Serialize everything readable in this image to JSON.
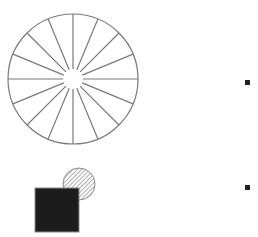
{
  "diagram": {
    "wheel": {
      "name": "spoked-wheel",
      "spoke_count": 16,
      "stroke_color": "#7a7a7a"
    },
    "composite": {
      "square": {
        "fill_color": "#1c1c1c",
        "stroke_color": "#8a8a8a"
      },
      "circle": {
        "pattern": "diagonal-hatch",
        "hatch_color": "#8c8c8c",
        "stroke_color": "#8a8a8a"
      }
    },
    "markers": [
      {
        "name": "bullet-marker-1",
        "color": "#222222"
      },
      {
        "name": "bullet-marker-2",
        "color": "#222222"
      }
    ]
  }
}
